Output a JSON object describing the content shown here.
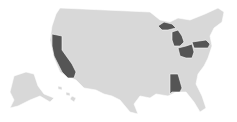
{
  "map": {
    "type": "choropleth",
    "region": "United States",
    "colors": {
      "background": "#ffffff",
      "default_state": "#d8d8d8",
      "highlighted_state": "#555555",
      "border": "#ffffff"
    },
    "highlighted_states": [
      "California",
      "Michigan",
      "Ohio",
      "Pennsylvania",
      "Alabama"
    ]
  }
}
